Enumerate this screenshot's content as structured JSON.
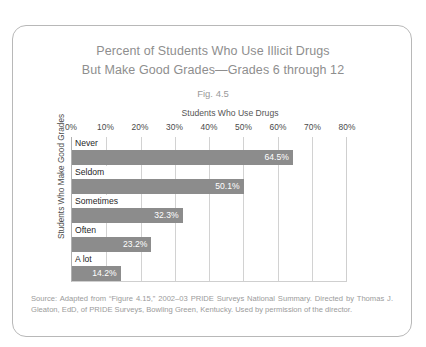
{
  "figure": {
    "title_line1": "Percent of Students Who Use Illicit Drugs",
    "title_line2": "But Make Good Grades—Grades 6 through 12",
    "figure_number": "Fig. 4.5",
    "source_note": "Source: Adapted from “Figure 4.15,” 2002–03 PRIDE Surveys National Summary. Directed by Thomas J. Gleaton, EdD, of PRIDE Surveys, Bowling Green, Kentucky. Used by permission of the director."
  },
  "chart_data": {
    "type": "bar",
    "orientation": "horizontal",
    "title": "Percent of Students Who Use Illicit Drugs But Make Good Grades—Grades 6 through 12",
    "xlabel": "Students Who Use Drugs",
    "ylabel": "Students Who Make Good Grades",
    "categories": [
      "Never",
      "Seldom",
      "Sometimes",
      "Often",
      "A lot"
    ],
    "values": [
      64.5,
      50.1,
      32.3,
      23.2,
      14.2
    ],
    "value_labels": [
      "64.5%",
      "50.1%",
      "32.3%",
      "23.2%",
      "14.2%"
    ],
    "xlim": [
      0,
      80
    ],
    "xticks": [
      0,
      10,
      20,
      30,
      40,
      50,
      60,
      70,
      80
    ],
    "xtick_labels": [
      "0%",
      "10%",
      "20%",
      "30%",
      "40%",
      "50%",
      "60%",
      "70%",
      "80%"
    ],
    "grid": true,
    "legend": false,
    "bar_color": "#8c8c8c",
    "gridline_color": "#d2d2d2",
    "value_label_color": "#ffffff"
  }
}
